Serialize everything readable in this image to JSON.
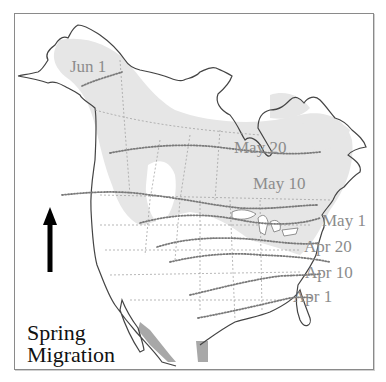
{
  "title": {
    "line1": "Spring",
    "line2": "Migration"
  },
  "arrow": {
    "direction": "north",
    "icon": "up-arrow-icon"
  },
  "isochrone_labels": [
    {
      "id": "jun1",
      "text": "Jun 1"
    },
    {
      "id": "may20",
      "text": "May 20"
    },
    {
      "id": "may10",
      "text": "May 10"
    },
    {
      "id": "may1",
      "text": "May 1"
    },
    {
      "id": "apr20",
      "text": "Apr 20"
    },
    {
      "id": "apr10",
      "text": "Apr 10"
    },
    {
      "id": "apr1",
      "text": "Apr 1"
    }
  ],
  "colors": {
    "breeding_range": "#e6e6e6",
    "wintering_range": "#a8a8a8",
    "coastline": "#444444",
    "borders": "#9a9a9a",
    "isochrones": "#7a7a7a",
    "label_text": "#8c8c8c",
    "title_text": "#111111"
  }
}
